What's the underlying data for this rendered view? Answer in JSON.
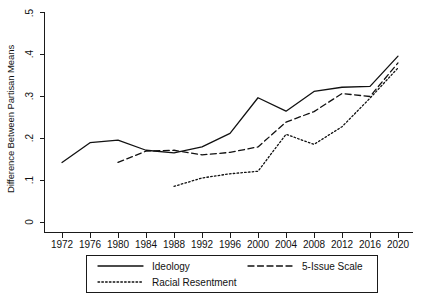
{
  "chart_data": {
    "type": "line",
    "title": "",
    "xlabel": "",
    "ylabel": "Difference Between Partisan Means",
    "x": [
      1972,
      1976,
      1980,
      1984,
      1988,
      1992,
      1996,
      2000,
      2004,
      2008,
      2012,
      2016,
      2020
    ],
    "categories": [
      "1972",
      "1976",
      "1980",
      "1984",
      "1988",
      "1992",
      "1996",
      "2000",
      "2004",
      "2008",
      "2012",
      "2016",
      "2020"
    ],
    "xlim": [
      1972,
      2020
    ],
    "ylim": [
      0,
      0.5
    ],
    "yticks": [
      0,
      0.1,
      0.2,
      0.3,
      0.4,
      0.5
    ],
    "ytick_labels": [
      "0",
      ".1",
      ".2",
      ".3",
      ".4",
      ".5"
    ],
    "grid": false,
    "legend_position": "bottom",
    "series": [
      {
        "name": "Ideology",
        "style": "solid",
        "color": "#111111",
        "x": [
          1972,
          1976,
          1980,
          1984,
          1988,
          1992,
          1996,
          2000,
          2004,
          2008,
          2012,
          2016,
          2020
        ],
        "values": [
          0.143,
          0.19,
          0.196,
          0.172,
          0.166,
          0.18,
          0.212,
          0.297,
          0.265,
          0.312,
          0.322,
          0.324,
          0.396
        ]
      },
      {
        "name": "5-Issue Scale",
        "style": "dashed",
        "color": "#111111",
        "x": [
          1980,
          1984,
          1988,
          1992,
          1996,
          2000,
          2004,
          2008,
          2012,
          2016,
          2020
        ],
        "values": [
          0.143,
          0.17,
          0.172,
          0.161,
          0.167,
          0.18,
          0.239,
          0.264,
          0.307,
          0.3,
          0.38
        ]
      },
      {
        "name": "Racial Resentment",
        "style": "dotted",
        "color": "#111111",
        "x": [
          1988,
          1992,
          1996,
          2000,
          2004,
          2008,
          2012,
          2016,
          2020
        ],
        "values": [
          0.086,
          0.106,
          0.116,
          0.122,
          0.21,
          0.186,
          0.228,
          0.296,
          0.368
        ]
      }
    ]
  },
  "axes": {
    "ylabel": "Difference Between Partisan Means",
    "ytick_labels": [
      "0",
      ".1",
      ".2",
      ".3",
      ".4",
      ".5"
    ],
    "xtick_labels": [
      "1972",
      "1976",
      "1980",
      "1984",
      "1988",
      "1992",
      "1996",
      "2000",
      "2004",
      "2008",
      "2012",
      "2016",
      "2020"
    ]
  },
  "legend": {
    "entries": [
      {
        "label": "Ideology",
        "style": "solid"
      },
      {
        "label": "5-Issue Scale",
        "style": "dashed"
      },
      {
        "label": "Racial Resentment",
        "style": "dotted"
      }
    ]
  }
}
